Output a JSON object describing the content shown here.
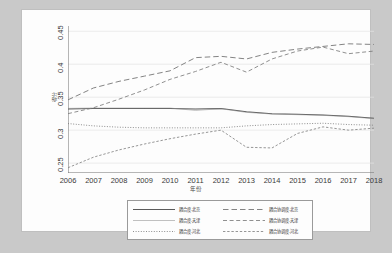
{
  "chart_data": {
    "type": "line",
    "title": "",
    "xlabel": "年份",
    "ylabel": "得分",
    "x": [
      2006,
      2007,
      2008,
      2009,
      2010,
      2011,
      2012,
      2013,
      2014,
      2015,
      2016,
      2017,
      2018
    ],
    "xlim": [
      2006,
      2018
    ],
    "ylim": [
      0.235,
      0.458
    ],
    "yticks": [
      0.25,
      0.3,
      0.35,
      0.4,
      0.45
    ],
    "ytick_labels": [
      "0.25",
      "0.3",
      "0.35",
      "0.4",
      "0.45"
    ],
    "xtick_labels": [
      "2006",
      "2007",
      "2008",
      "2009",
      "2010",
      "2011",
      "2012",
      "2013",
      "2014",
      "2015",
      "2016",
      "2017",
      "2018"
    ],
    "grid": "horizontal",
    "legend_position": "bottom-center",
    "series": [
      {
        "name": "耦合度-北京",
        "style": "solid",
        "color": "#5a5a5a",
        "values": [
          0.332,
          0.333,
          0.333,
          0.333,
          0.333,
          0.332,
          0.333,
          0.328,
          0.325,
          0.324,
          0.323,
          0.321,
          0.318
        ]
      },
      {
        "name": "耦合度-天津",
        "style": "thin-solid",
        "color": "#8d8d8d",
        "values": [
          0.333,
          0.3335,
          0.3335,
          0.3335,
          0.3335,
          0.33,
          0.3325,
          0.327,
          0.3245,
          0.3235,
          0.3225,
          0.3205,
          0.3175
        ]
      },
      {
        "name": "耦合度-河北",
        "style": "dotted",
        "color": "#7a7a7a",
        "values": [
          0.31,
          0.3065,
          0.3045,
          0.3035,
          0.3035,
          0.3035,
          0.3035,
          0.3065,
          0.3085,
          0.3095,
          0.3105,
          0.3085,
          0.3075
        ]
      },
      {
        "name": "耦合协调度-北京",
        "style": "long-dash",
        "color": "#6e6e6e",
        "values": [
          0.346,
          0.364,
          0.374,
          0.382,
          0.39,
          0.41,
          0.412,
          0.408,
          0.418,
          0.423,
          0.427,
          0.431,
          0.43
        ]
      },
      {
        "name": "耦合协调度-天津",
        "style": "dash",
        "color": "#7c7c7c",
        "values": [
          0.325,
          0.334,
          0.347,
          0.361,
          0.377,
          0.389,
          0.403,
          0.388,
          0.408,
          0.42,
          0.426,
          0.416,
          0.42
        ]
      },
      {
        "name": "耦合协调度-河北",
        "style": "dash-dot",
        "color": "#8a8a8a",
        "values": [
          0.243,
          0.259,
          0.27,
          0.279,
          0.287,
          0.294,
          0.3,
          0.274,
          0.273,
          0.295,
          0.305,
          0.3,
          0.303
        ]
      }
    ]
  },
  "legend": {
    "items": [
      {
        "label": "耦合度-北京",
        "style": "solid"
      },
      {
        "label": "耦合协调度-北京",
        "style": "long-dash"
      },
      {
        "label": "耦合度-天津",
        "style": "thin-solid"
      },
      {
        "label": "耦合协调度-天津",
        "style": "dash"
      },
      {
        "label": "耦合度-河北",
        "style": "dotted"
      },
      {
        "label": "耦合协调度-河北",
        "style": "dash-dot"
      }
    ]
  },
  "colors": {
    "background": "#c9c9c9",
    "panel": "#fdfdfd",
    "axis": "#6f6f6f",
    "grid": "#e4e4e4"
  }
}
